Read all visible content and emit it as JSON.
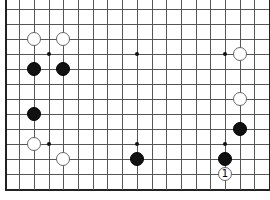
{
  "board": {
    "size": 19,
    "visible_rows": 13,
    "origin_x": 4.5,
    "origin_y": 9,
    "spacing_x": 14.7,
    "spacing_y": 15,
    "edges": {
      "left": true,
      "right": true,
      "bottom": true,
      "top": false
    },
    "line_color": "#555555",
    "edge_color": "#222222"
  },
  "star_points": [
    {
      "col": 3,
      "row": 3
    },
    {
      "col": 9,
      "row": 3
    },
    {
      "col": 15,
      "row": 3
    },
    {
      "col": 3,
      "row": 9
    },
    {
      "col": 9,
      "row": 9
    },
    {
      "col": 15,
      "row": 9
    }
  ],
  "stones": [
    {
      "color": "white",
      "col": 2,
      "row": 2,
      "label": ""
    },
    {
      "color": "white",
      "col": 4,
      "row": 2,
      "label": ""
    },
    {
      "color": "black",
      "col": 2,
      "row": 4,
      "label": ""
    },
    {
      "color": "black",
      "col": 4,
      "row": 4,
      "label": ""
    },
    {
      "color": "white",
      "col": 16,
      "row": 3,
      "label": ""
    },
    {
      "color": "white",
      "col": 16,
      "row": 6,
      "label": ""
    },
    {
      "color": "black",
      "col": 2,
      "row": 7,
      "label": ""
    },
    {
      "color": "black",
      "col": 16,
      "row": 8,
      "label": ""
    },
    {
      "color": "white",
      "col": 2,
      "row": 9,
      "label": ""
    },
    {
      "color": "white",
      "col": 4,
      "row": 10,
      "label": ""
    },
    {
      "color": "black",
      "col": 9,
      "row": 10,
      "label": ""
    },
    {
      "color": "black",
      "col": 15,
      "row": 10,
      "label": ""
    },
    {
      "color": "white",
      "col": 15,
      "row": 11,
      "label": "1"
    }
  ]
}
